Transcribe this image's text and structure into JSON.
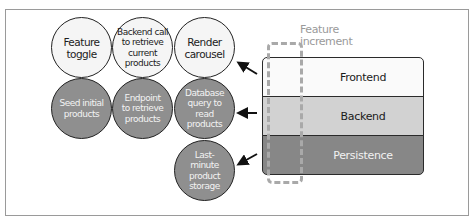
{
  "diagram": {
    "increment_label": [
      "Feature",
      "increment"
    ],
    "layers": [
      {
        "id": "frontend",
        "label": "Frontend",
        "color": "#fafafa"
      },
      {
        "id": "backend",
        "label": "Backend",
        "color": "#d2d2d2"
      },
      {
        "id": "persistence",
        "label": "Persistence",
        "color": "#878787"
      }
    ],
    "tasks": {
      "frontend": [
        "Feature\ntoggle",
        "Backend call\nto retrieve\ncurrent\nproducts",
        "Render\ncarousel"
      ],
      "backend": [
        "Seed initial\nproducts",
        "Endpoint\nto retrieve\nproducts",
        "Database\nquery to read\nproducts"
      ],
      "persistence": [
        "Last-\nminute\nproduct\nstorage"
      ]
    },
    "arrows": [
      {
        "from": "frontend",
        "to": "Render carousel"
      },
      {
        "from": "backend",
        "to": "Database query to read products"
      },
      {
        "from": "persistence",
        "to": "Last-minute product storage"
      }
    ]
  }
}
